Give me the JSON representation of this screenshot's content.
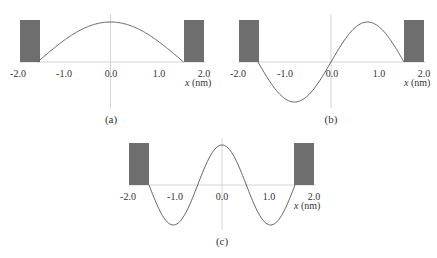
{
  "figure": {
    "panels": [
      {
        "id": "a",
        "caption": "(a)",
        "state": "n=1 ground state (cosine)",
        "x_ticks": [
          "-2.0",
          "-1.0",
          "0.0",
          "1.0",
          "2.0"
        ],
        "x_label_var": "x",
        "x_label_unit": "(nm)"
      },
      {
        "id": "b",
        "caption": "(b)",
        "state": "n=2 (sine)",
        "x_ticks": [
          "-2.0",
          "-1.0",
          "0.0",
          "1.0",
          "2.0"
        ],
        "x_label_var": "x",
        "x_label_unit": "(nm)"
      },
      {
        "id": "c",
        "caption": "(c)",
        "state": "n=3 (cosine)",
        "x_ticks": [
          "-2.0",
          "-1.0",
          "0.0",
          "1.0",
          "2.0"
        ],
        "x_label_var": "x",
        "x_label_unit": "(nm)"
      }
    ],
    "colors": {
      "barrier": "#6e6e6e",
      "curve": "#555555",
      "axis": "#cfcfcf",
      "text": "#333333"
    },
    "well": {
      "half_width_nm": 1.57,
      "barrier_extent_nm": [
        1.57,
        2.0
      ],
      "x_range_nm": [
        -2.0,
        2.0
      ]
    }
  }
}
